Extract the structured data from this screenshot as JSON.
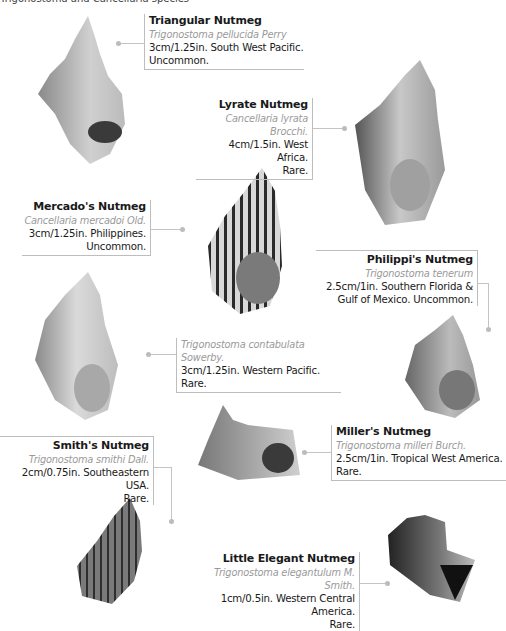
{
  "page": {
    "top_cut_text": "Trigonostoma and Cancellaria species"
  },
  "entries": [
    {
      "id": "triangular",
      "title": "Triangular Nutmeg",
      "scientific": "Trigonostoma pellucida Perry",
      "size": "3cm/1.25in. South West Pacific.",
      "rarity": "Uncommon."
    },
    {
      "id": "lyrate",
      "title": "Lyrate Nutmeg",
      "scientific": "Cancellaria lyrata Brocchi.",
      "size": "4cm/1.5in. West Africa.",
      "rarity": "Rare."
    },
    {
      "id": "mercado",
      "title": "Mercado's Nutmeg",
      "scientific": "Cancellaria mercadoi Old.",
      "size": "3cm/1.25in. Philippines.",
      "rarity": "Uncommon."
    },
    {
      "id": "philippi",
      "title": "Philippi's Nutmeg",
      "scientific": "Trigonostoma tenerum",
      "size": "2.5cm/1in. Southern Florida &",
      "rarity": "Gulf of Mexico. Uncommon."
    },
    {
      "id": "contabulata",
      "title": "",
      "scientific": "Trigonostoma contabulata Sowerby.",
      "size": "3cm/1.25in. Western Pacific.",
      "rarity": "Rare."
    },
    {
      "id": "miller",
      "title": "Miller's Nutmeg",
      "scientific": "Trigonostoma milleri Burch.",
      "size": "2.5cm/1in. Tropical West America.",
      "rarity": "Rare."
    },
    {
      "id": "smith",
      "title": "Smith's Nutmeg",
      "scientific": "Trigonostoma smithi Dall.",
      "size": "2cm/0.75in. Southeastern USA.",
      "rarity": "Rare."
    },
    {
      "id": "little-elegant",
      "title": "Little Elegant Nutmeg",
      "scientific": "Trigonostoma elegantulum M. Smith.",
      "size": "1cm/0.5in. Western Central America.",
      "rarity": "Rare."
    }
  ],
  "colors": {
    "border": "#bdbdbd",
    "scientific_text": "#9a9a9a",
    "body_text": "#1a1a1a",
    "leader": "#c4c4c4"
  }
}
